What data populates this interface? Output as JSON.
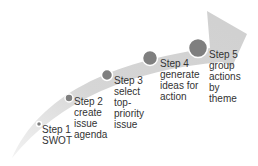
{
  "diagram": {
    "type": "curved-arrow-process",
    "arrow_color": "#d4d4d4",
    "circle_color": "#7f7f7f",
    "steps": [
      {
        "title": "Step 1",
        "lines": [
          "SWOT"
        ]
      },
      {
        "title": "Step 2",
        "lines": [
          "create",
          "issue",
          "agenda"
        ]
      },
      {
        "title": "Step 3",
        "lines": [
          "select",
          "top-",
          "priority",
          "issue"
        ]
      },
      {
        "title": "Step 4",
        "lines": [
          "generate",
          "ideas for",
          "action"
        ]
      },
      {
        "title": "Step 5",
        "lines": [
          "group",
          "actions",
          "by",
          "theme"
        ]
      }
    ]
  }
}
